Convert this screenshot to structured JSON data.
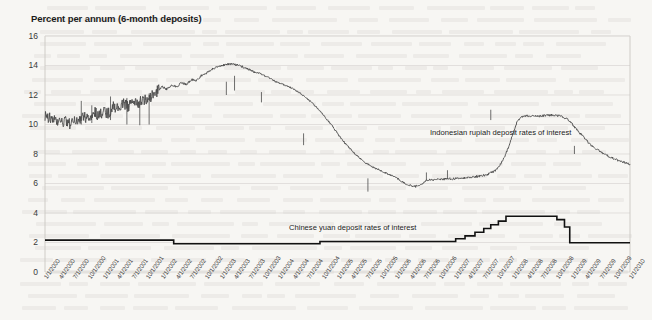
{
  "chart_data": {
    "type": "line",
    "title": "Percent per annum (6-month deposits)",
    "xlabel": "",
    "ylabel": "",
    "ylim": [
      0,
      16
    ],
    "yticks": [
      0,
      2,
      4,
      6,
      8,
      10,
      12,
      14,
      16
    ],
    "grid": true,
    "legend_position": "inline-annotation",
    "x_tick_labels": [
      "1/1/2000",
      "4/1/2000",
      "7/1/2000",
      "10/1/2000",
      "1/1/2001",
      "4/1/2001",
      "7/1/2001",
      "10/1/2001",
      "1/1/2002",
      "4/1/2002",
      "7/1/2002",
      "10/1/2002",
      "1/1/2003",
      "4/1/2003",
      "7/1/2003",
      "10/1/2003",
      "1/1/2004",
      "4/1/2004",
      "7/1/2004",
      "10/1/2004",
      "1/1/2005",
      "4/1/2005",
      "7/1/2005",
      "10/1/2005",
      "1/1/2006",
      "4/1/2006",
      "7/1/2006",
      "10/1/2006",
      "1/1/2007",
      "4/1/2007",
      "7/1/2007",
      "10/1/2007",
      "1/1/2008",
      "4/1/2008",
      "7/1/2008",
      "10/1/2008",
      "1/1/2009",
      "4/1/2009",
      "7/1/2009",
      "10/1/2009",
      "1/1/2010"
    ],
    "series": [
      {
        "name": "Indonesian rupiah deposit rates of interest",
        "color": "#4a4a4a",
        "label_text": "Indonesian rupiah deposit rates of interest",
        "x": [
          0.0,
          0.08,
          0.17,
          0.25,
          0.33,
          0.42,
          0.5,
          0.58,
          0.67,
          0.75,
          0.83,
          0.92,
          1.0,
          1.08,
          1.17,
          1.25,
          1.33,
          1.42,
          1.5,
          1.58,
          1.67,
          1.75,
          1.83,
          1.92,
          2.0,
          2.08,
          2.17,
          2.25,
          2.33,
          2.42,
          2.5,
          2.58,
          2.67,
          2.75,
          2.83,
          2.92,
          3.0,
          3.08,
          3.17,
          3.25,
          3.33,
          3.42,
          3.5,
          3.58,
          3.67,
          3.75,
          3.83,
          3.92,
          4.0,
          4.08,
          4.17,
          4.25,
          4.33,
          4.42,
          4.5,
          4.58,
          4.67,
          4.75,
          4.83,
          4.92,
          5.0,
          5.08,
          5.17,
          5.25,
          5.33,
          5.42,
          5.5,
          5.58,
          5.67,
          5.75,
          5.83,
          5.92,
          6.0,
          6.08,
          6.17,
          6.25,
          6.33,
          6.42,
          6.5,
          6.58,
          6.67,
          6.75,
          6.83,
          6.92,
          7.0,
          7.08,
          7.17,
          7.25,
          7.33,
          7.42,
          7.5,
          7.58,
          7.67,
          7.75,
          7.83,
          7.92,
          8.0,
          8.08,
          8.17,
          8.25,
          8.33,
          8.42,
          8.5,
          8.58,
          8.67,
          8.75,
          8.83,
          8.92,
          9.0,
          9.08,
          9.17,
          9.25,
          9.33,
          9.42,
          9.5,
          9.58,
          9.67,
          9.75,
          9.83,
          9.92,
          10.0
        ],
        "values": [
          10.6,
          10.45,
          10.25,
          10.1,
          10.2,
          10.05,
          10.15,
          10.35,
          10.6,
          10.3,
          10.9,
          10.55,
          11.0,
          10.7,
          11.3,
          11.05,
          11.45,
          11.2,
          11.6,
          11.35,
          11.75,
          11.5,
          11.95,
          12.3,
          12.55,
          12.4,
          12.7,
          12.55,
          12.85,
          12.7,
          13.05,
          12.95,
          13.3,
          13.45,
          13.7,
          13.85,
          14.0,
          14.05,
          14.1,
          14.05,
          14.0,
          13.85,
          13.7,
          13.55,
          13.45,
          13.3,
          13.15,
          12.95,
          12.8,
          12.7,
          12.55,
          12.4,
          12.2,
          11.95,
          11.7,
          11.4,
          11.05,
          10.7,
          10.3,
          9.85,
          9.4,
          8.95,
          8.55,
          8.2,
          7.9,
          7.6,
          7.35,
          7.15,
          7.0,
          6.85,
          6.7,
          6.55,
          6.4,
          6.2,
          5.95,
          5.85,
          5.8,
          5.85,
          6.2,
          6.25,
          6.28,
          6.3,
          6.3,
          6.32,
          6.33,
          6.35,
          6.38,
          6.4,
          6.45,
          6.5,
          6.55,
          6.65,
          6.8,
          7.1,
          7.6,
          8.4,
          9.4,
          10.3,
          10.55,
          10.6,
          10.58,
          10.55,
          10.6,
          10.62,
          10.65,
          10.6,
          10.55,
          10.4,
          10.1,
          9.7,
          9.3,
          8.95,
          8.6,
          8.35,
          8.15,
          7.95,
          7.8,
          7.65,
          7.5,
          7.4,
          7.3
        ],
        "x_extra": [
          10.08,
          10.17,
          10.25,
          10.33,
          10.42,
          10.5,
          10.58,
          10.67,
          10.75,
          10.83,
          10.92,
          11.0
        ],
        "values_extra": [
          7.2,
          7.1,
          7.0,
          6.95,
          6.9,
          6.88,
          6.9,
          7.2,
          7.8,
          8.45,
          8.75,
          8.7
        ]
      },
      {
        "name": "Chinese yuan deposit rates of interest",
        "color": "#111111",
        "label_text": "Chinese yuan deposit rates of interest",
        "steps": [
          {
            "x_start": 0.0,
            "x_end": 2.2,
            "value": 2.16
          },
          {
            "x_start": 2.2,
            "x_end": 4.7,
            "value": 1.92
          },
          {
            "x_start": 4.7,
            "x_end": 7.02,
            "value": 2.07
          },
          {
            "x_start": 7.02,
            "x_end": 7.18,
            "value": 2.25
          },
          {
            "x_start": 7.18,
            "x_end": 7.35,
            "value": 2.45
          },
          {
            "x_start": 7.35,
            "x_end": 7.5,
            "value": 2.7
          },
          {
            "x_start": 7.5,
            "x_end": 7.62,
            "value": 2.95
          },
          {
            "x_start": 7.62,
            "x_end": 7.75,
            "value": 3.2
          },
          {
            "x_start": 7.75,
            "x_end": 7.88,
            "value": 3.45
          },
          {
            "x_start": 7.88,
            "x_end": 8.75,
            "value": 3.78
          },
          {
            "x_start": 8.75,
            "x_end": 8.88,
            "value": 3.55
          },
          {
            "x_start": 8.88,
            "x_end": 8.97,
            "value": 3.05
          },
          {
            "x_start": 8.97,
            "x_end": 10.0,
            "value": 1.98
          }
        ]
      }
    ],
    "annotations": [
      {
        "text": "Indonesian rupiah deposit rates of interest",
        "x": 7.05,
        "y": 9.2
      },
      {
        "text": "Chinese yuan deposit rates of interest",
        "x": 4.35,
        "y": 3.05
      }
    ]
  }
}
